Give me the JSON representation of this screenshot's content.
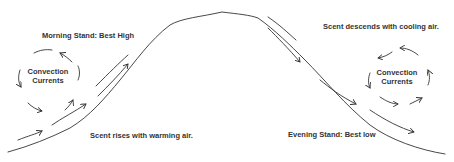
{
  "diagram": {
    "title_partial": "",
    "labels": {
      "morning_stand": "Morning Stand: Best High",
      "scent_descends": "Scent descends with cooling air.",
      "scent_rises": "Scent rises with warming air.",
      "evening_stand": "Evening Stand: Best low"
    },
    "convection_left": {
      "line1": "Convection",
      "line2": "Currents"
    },
    "convection_right": {
      "line1": "Convection",
      "line2": "Currents"
    },
    "colors": {
      "stroke": "#333333",
      "text": "#333333",
      "background": "#ffffff"
    }
  }
}
